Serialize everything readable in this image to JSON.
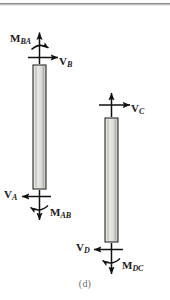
{
  "figure": {
    "caption": "(d)",
    "colors": {
      "member_fill_light": "#f2f2f0",
      "member_fill_mid": "#d2d2cf",
      "member_outline": "#2b2b2b",
      "arrow": "#111111",
      "top_rule": "#8a8a8a",
      "caption_text": "#6d6d6d"
    }
  },
  "members": [
    {
      "id": "member-ab",
      "name": "column-ab",
      "x": 33,
      "y": 65,
      "width": 13,
      "height": 124
    },
    {
      "id": "member-cd",
      "name": "column-cd",
      "x": 105,
      "y": 118,
      "width": 13,
      "height": 124
    }
  ],
  "labels": {
    "m_ba": {
      "main": "M",
      "sub": "BA"
    },
    "v_b": {
      "main": "V",
      "sub": "B"
    },
    "v_a": {
      "main": "V",
      "sub": "A"
    },
    "m_ab": {
      "main": "M",
      "sub": "AB"
    },
    "v_c": {
      "main": "V",
      "sub": "C"
    },
    "v_d": {
      "main": "V",
      "sub": "D"
    },
    "m_dc": {
      "main": "M",
      "sub": "DC"
    }
  },
  "force_annotations": [
    {
      "name": "moment-ba",
      "label": "M_BA",
      "type": "moment",
      "sense": "clockwise",
      "at": "top-of-member-ab"
    },
    {
      "name": "shear-b",
      "label": "V_B",
      "type": "shear",
      "direction": "right",
      "at": "top-of-member-ab"
    },
    {
      "name": "axial-b",
      "label": "",
      "type": "axial",
      "direction": "up",
      "at": "top-of-member-ab"
    },
    {
      "name": "shear-a",
      "label": "V_A",
      "type": "shear",
      "direction": "left",
      "at": "bottom-of-member-ab"
    },
    {
      "name": "moment-ab",
      "label": "M_AB",
      "type": "moment",
      "sense": "counterclockwise",
      "at": "bottom-of-member-ab"
    },
    {
      "name": "axial-a",
      "label": "",
      "type": "axial",
      "direction": "down",
      "at": "bottom-of-member-ab"
    },
    {
      "name": "shear-c",
      "label": "V_C",
      "type": "shear",
      "direction": "right",
      "at": "top-of-member-cd"
    },
    {
      "name": "axial-c",
      "label": "",
      "type": "axial",
      "direction": "up",
      "at": "top-of-member-cd"
    },
    {
      "name": "shear-d",
      "label": "V_D",
      "type": "shear",
      "direction": "left",
      "at": "bottom-of-member-cd"
    },
    {
      "name": "moment-dc",
      "label": "M_DC",
      "type": "moment",
      "sense": "counterclockwise",
      "at": "bottom-of-member-cd"
    },
    {
      "name": "axial-d",
      "label": "",
      "type": "axial",
      "direction": "down",
      "at": "bottom-of-member-cd"
    }
  ]
}
